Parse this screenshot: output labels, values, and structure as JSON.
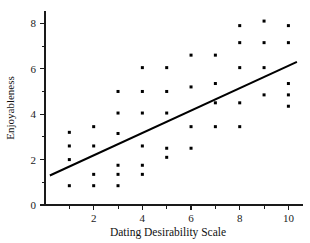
{
  "chart_data": {
    "type": "scatter",
    "title": "",
    "xlabel": "Dating Desirability Scale",
    "ylabel": "Enjoyableness",
    "xlim": [
      0,
      10.6
    ],
    "ylim": [
      0,
      8.5
    ],
    "grid": false,
    "legend": "none",
    "x_ticks_major": [
      2,
      4,
      6,
      8,
      10
    ],
    "x_ticks_minor": [
      1,
      3,
      5,
      7,
      9
    ],
    "y_ticks_major": [
      0,
      2,
      4,
      6,
      8
    ],
    "y_ticks_minor": [
      1,
      3,
      5,
      7
    ],
    "x_tick_labels": [
      "2",
      "4",
      "6",
      "8",
      "10"
    ],
    "y_tick_labels": [
      "0",
      "2",
      "4",
      "6",
      "8"
    ],
    "points": [
      {
        "x": 1,
        "y": 3.2
      },
      {
        "x": 1,
        "y": 2.6
      },
      {
        "x": 1,
        "y": 2.0
      },
      {
        "x": 1,
        "y": 0.85
      },
      {
        "x": 2,
        "y": 3.45
      },
      {
        "x": 2,
        "y": 2.6
      },
      {
        "x": 2,
        "y": 1.35
      },
      {
        "x": 2,
        "y": 0.85
      },
      {
        "x": 3,
        "y": 5.0
      },
      {
        "x": 3,
        "y": 4.05
      },
      {
        "x": 3,
        "y": 3.15
      },
      {
        "x": 3,
        "y": 1.75
      },
      {
        "x": 3,
        "y": 1.35
      },
      {
        "x": 3,
        "y": 0.85
      },
      {
        "x": 4,
        "y": 6.05
      },
      {
        "x": 4,
        "y": 5.0
      },
      {
        "x": 4,
        "y": 4.05
      },
      {
        "x": 4,
        "y": 2.6
      },
      {
        "x": 4,
        "y": 1.75
      },
      {
        "x": 4,
        "y": 1.35
      },
      {
        "x": 5,
        "y": 6.05
      },
      {
        "x": 5,
        "y": 5.0
      },
      {
        "x": 5,
        "y": 4.05
      },
      {
        "x": 5,
        "y": 2.5
      },
      {
        "x": 5,
        "y": 2.1
      },
      {
        "x": 6,
        "y": 6.6
      },
      {
        "x": 6,
        "y": 5.2
      },
      {
        "x": 6,
        "y": 3.45
      },
      {
        "x": 6,
        "y": 2.5
      },
      {
        "x": 7,
        "y": 6.6
      },
      {
        "x": 7,
        "y": 5.35
      },
      {
        "x": 7,
        "y": 4.5
      },
      {
        "x": 7,
        "y": 3.45
      },
      {
        "x": 8,
        "y": 7.9
      },
      {
        "x": 8,
        "y": 7.15
      },
      {
        "x": 8,
        "y": 6.05
      },
      {
        "x": 8,
        "y": 4.5
      },
      {
        "x": 8,
        "y": 3.45
      },
      {
        "x": 9,
        "y": 8.1
      },
      {
        "x": 9,
        "y": 7.15
      },
      {
        "x": 9,
        "y": 6.05
      },
      {
        "x": 9,
        "y": 4.85
      },
      {
        "x": 10,
        "y": 7.9
      },
      {
        "x": 10,
        "y": 7.15
      },
      {
        "x": 10,
        "y": 5.35
      },
      {
        "x": 10,
        "y": 4.85
      },
      {
        "x": 10,
        "y": 4.35
      }
    ],
    "fit_line": {
      "x_start": 0.2,
      "y_start": 1.3,
      "x_end": 10.35,
      "y_end": 6.3
    },
    "marker_color": "#000000",
    "line_color": "#000000",
    "axis_color": "#1a1a1a"
  }
}
